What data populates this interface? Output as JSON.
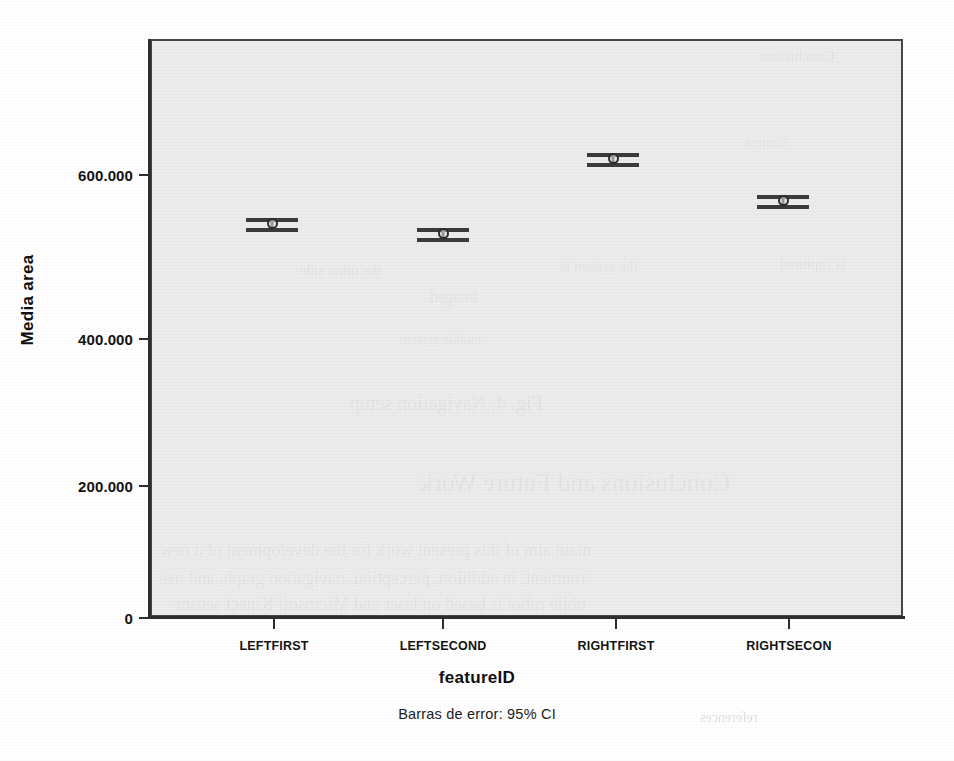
{
  "chart_data": {
    "type": "scatter",
    "title": "",
    "subtitle": "",
    "caption": "Barras de error: 95% CI",
    "xlabel": "featureID",
    "ylabel": "Media area",
    "categories": [
      "LEFTFIRST",
      "LEFTSECOND",
      "RIGHTFIRST",
      "RIGHTSECON"
    ],
    "values": [
      531.0,
      517.0,
      619.0,
      562.0
    ],
    "error_low": [
      526.0,
      512.0,
      614.0,
      557.0
    ],
    "error_high": [
      536.0,
      522.0,
      624.0,
      567.0
    ],
    "error_type": "95% CI",
    "ylim": [
      0,
      760
    ],
    "yticks": [
      0,
      200,
      400,
      600
    ],
    "ytick_labels": [
      "0",
      "200.000",
      "400.000",
      "600.000"
    ],
    "grid": false,
    "legend": "none",
    "plot_background": "#e5e5e5",
    "marker_color": "#2b2b2b",
    "series": [
      {
        "name": "Media area",
        "points": [
          {
            "category": "LEFTFIRST",
            "value": 531.0,
            "ci_low": 526.0,
            "ci_high": 536.0
          },
          {
            "category": "LEFTSECOND",
            "value": 517.0,
            "ci_low": 512.0,
            "ci_high": 522.0
          },
          {
            "category": "RIGHTFIRST",
            "value": 619.0,
            "ci_low": 614.0,
            "ci_high": 624.0
          },
          {
            "category": "RIGHTSECON",
            "value": 562.0,
            "ci_low": 557.0,
            "ci_high": 567.0
          }
        ]
      }
    ]
  },
  "axes": {
    "y": {
      "title": "Media area",
      "ticks": [
        {
          "label": "600.000",
          "top": 167,
          "tick_top": 174
        },
        {
          "label": "400.000",
          "top": 331,
          "tick_top": 338
        },
        {
          "label": "200.000",
          "top": 478,
          "tick_top": 485
        },
        {
          "label": "0",
          "top": 610,
          "tick_top": 617
        }
      ]
    },
    "x": {
      "title": "featureID",
      "ticks": [
        {
          "label": "LEFTFIRST",
          "left": 273
        },
        {
          "label": "LEFTSECOND",
          "left": 442
        },
        {
          "label": "RIGHTFIRST",
          "left": 615
        },
        {
          "label": "RIGHTSECON",
          "left": 788
        }
      ]
    }
  },
  "marks": [
    {
      "name": "errorbar-leftfirst",
      "left": 272,
      "top": 225,
      "whisker_width": 52
    },
    {
      "name": "errorbar-leftsecond",
      "left": 443,
      "top": 235,
      "whisker_width": 52
    },
    {
      "name": "errorbar-rightfirst",
      "left": 613,
      "top": 160,
      "whisker_width": 52
    },
    {
      "name": "errorbar-rightsecon",
      "left": 783,
      "top": 202,
      "whisker_width": 52
    }
  ],
  "bleed_through": {
    "note": "faint mirrored text from the reverse page of the scan",
    "lines": [
      {
        "text": "Conclusions",
        "left": 760,
        "top": 48,
        "size": 15
      },
      {
        "text": "camera",
        "left": 745,
        "top": 135,
        "size": 14
      },
      {
        "text": "the other side",
        "left": 300,
        "top": 262,
        "size": 15
      },
      {
        "text": "the system is",
        "left": 560,
        "top": 258,
        "size": 15
      },
      {
        "text": "is captured",
        "left": 780,
        "top": 256,
        "size": 15
      },
      {
        "text": "Imaged",
        "left": 430,
        "top": 288,
        "size": 16
      },
      {
        "text": "mobile system",
        "left": 400,
        "top": 332,
        "size": 14
      },
      {
        "text": "Fig. 4. Navigation setup",
        "left": 350,
        "top": 392,
        "size": 20
      },
      {
        "text": "Conclusions and Future Work",
        "left": 420,
        "top": 468,
        "size": 26
      },
      {
        "text": "main aim of this present work for the development of a new",
        "left": 160,
        "top": 540,
        "size": 18
      },
      {
        "text": "ronment, in addition, perception, navigation graph, and use",
        "left": 160,
        "top": 568,
        "size": 18
      },
      {
        "text": "obile robot is based on laser and Microsoft Kinect sensor",
        "left": 175,
        "top": 594,
        "size": 18
      },
      {
        "text": "references",
        "left": 700,
        "top": 710,
        "size": 14
      }
    ]
  }
}
